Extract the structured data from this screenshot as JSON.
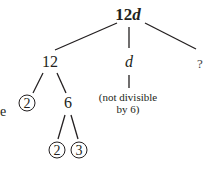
{
  "tree": {
    "root": {
      "number": "12",
      "variable": "d"
    },
    "level1": [
      {
        "label": "12"
      },
      {
        "label": "d"
      },
      {
        "label": "?"
      }
    ],
    "level2_from_12": [
      {
        "label": "2",
        "circled": true
      },
      {
        "label": "6",
        "circled": false
      }
    ],
    "note_under_d": {
      "line1": "(not divisible",
      "line2": "by 6)"
    },
    "level3_from_6": [
      {
        "label": "2",
        "circled": true
      },
      {
        "label": "3",
        "circled": true
      }
    ],
    "cut_off_left_text": "e"
  },
  "colors": {
    "ink": "#231f20",
    "background": "#ffffff"
  }
}
